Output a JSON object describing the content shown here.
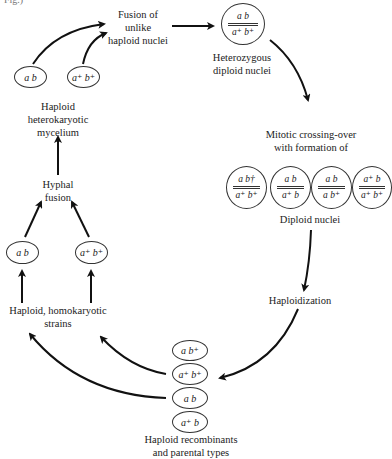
{
  "header_fragment": "Fig.)",
  "labels": {
    "fusion": [
      "Fusion of",
      "unlike",
      "haploid nuclei"
    ],
    "heterozygous": [
      "Heterozygous",
      "diploid nuclei"
    ],
    "mitotic": [
      "Mitotic crossing-over",
      "with formation of"
    ],
    "diploid": "Diploid nuclei",
    "haploidization": "Haploidization",
    "recombinants": [
      "Haploid recombinants",
      "and parental types"
    ],
    "homokaryotic": [
      "Haploid, homokaryotic",
      "strains"
    ],
    "hyphal": [
      "Hyphal",
      "fusion"
    ],
    "heterokaryotic": [
      "Haploid",
      "heterokaryotic",
      "mycelium"
    ]
  },
  "heterozygous_nucleus": {
    "top": "a   b",
    "bottom": "a⁺ b⁺"
  },
  "diploid_nuclei": [
    {
      "top": "a   b†",
      "bottom": "a⁺ b⁺"
    },
    {
      "top": "a   b",
      "bottom": "a⁺ b"
    },
    {
      "top": "a   b",
      "bottom": "a   b⁺"
    },
    {
      "top": "a⁺ b",
      "bottom": "a⁺ b⁺"
    }
  ],
  "heterokaryon_nuclei": [
    "a   b",
    "a⁺ b⁺"
  ],
  "homokaryotic_strains": [
    "a   b",
    "a⁺ b⁺"
  ],
  "recombinant_nuclei": [
    "a   b⁺",
    "a⁺ b⁺",
    "a   b",
    "a⁺ b"
  ]
}
